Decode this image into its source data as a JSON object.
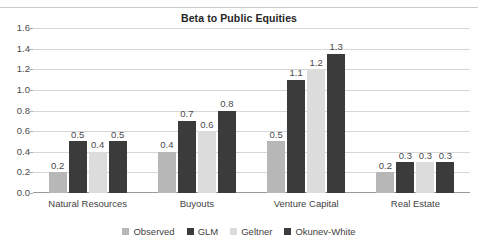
{
  "chart_data": {
    "type": "bar",
    "title": "Beta to Public Equities",
    "xlabel": "",
    "ylabel": "",
    "ylim": [
      0.0,
      1.6
    ],
    "yticks": [
      "0.0",
      "0.2",
      "0.4",
      "0.6",
      "0.8",
      "1.0",
      "1.2",
      "1.4",
      "1.6"
    ],
    "grid": true,
    "legend_position": "bottom",
    "categories": [
      "Natural Resources",
      "Buyouts",
      "Venture Capital",
      "Real Estate"
    ],
    "series": [
      {
        "name": "Observed",
        "color": "#b7b7b7",
        "values": [
          0.2,
          0.4,
          0.5,
          0.2
        ],
        "labels": [
          "0.2",
          "0.4",
          "0.5",
          "0.2"
        ]
      },
      {
        "name": "GLM",
        "color": "#3b3b3b",
        "values": [
          0.5,
          0.7,
          1.1,
          0.3
        ],
        "labels": [
          "0.5",
          "0.7",
          "1.1",
          "0.3"
        ]
      },
      {
        "name": "Geltner",
        "color": "#dcdcdc",
        "values": [
          0.4,
          0.6,
          1.2,
          0.3
        ],
        "labels": [
          "0.4",
          "0.6",
          "1.2",
          "0.3"
        ]
      },
      {
        "name": "Okunev-White",
        "color": "#3b3b3b",
        "values": [
          0.5,
          0.8,
          1.35,
          0.3
        ],
        "labels": [
          "0.5",
          "0.8",
          "1.3",
          "0.3"
        ]
      }
    ]
  },
  "colors": {
    "gridline": "#d6d6d6",
    "axis": "#9a9a9a",
    "title_text": "#262626",
    "tick_text": "#4a4a4a"
  }
}
